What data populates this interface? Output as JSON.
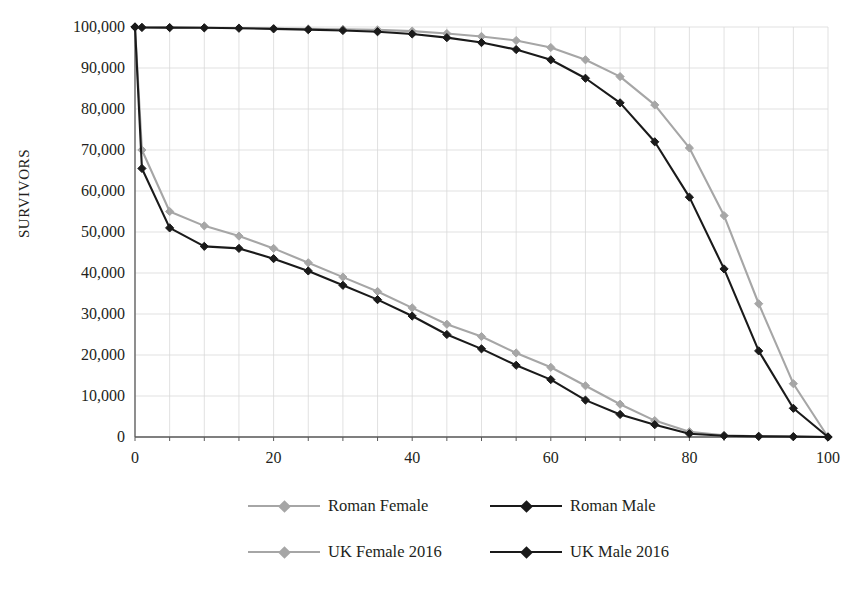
{
  "chart_data": {
    "type": "line",
    "title": "",
    "subtitle": "",
    "xlabel": "",
    "ylabel": "SURVIVORS",
    "xlim": [
      0,
      100
    ],
    "ylim": [
      0,
      100000
    ],
    "xticks": [
      0,
      20,
      40,
      60,
      80,
      100
    ],
    "xtick_labels": [
      "0",
      "20",
      "40",
      "60",
      "80",
      "100"
    ],
    "yticks": [
      0,
      10000,
      20000,
      30000,
      40000,
      50000,
      60000,
      70000,
      80000,
      90000,
      100000
    ],
    "ytick_labels": [
      "0",
      "10,000",
      "20,000",
      "30,000",
      "40,000",
      "50,000",
      "60,000",
      "70,000",
      "80,000",
      "90,000",
      "100,000"
    ],
    "grid": true,
    "grid_color": "#d9d9d9",
    "legend_position": "bottom",
    "x": [
      0,
      1,
      5,
      10,
      15,
      20,
      25,
      30,
      35,
      40,
      45,
      50,
      55,
      60,
      65,
      70,
      75,
      80,
      85,
      90,
      95,
      100
    ],
    "series": [
      {
        "name": "Roman Female",
        "color": "#a6a6a6",
        "marker": "diamond",
        "values": [
          100000,
          70000,
          55000,
          51500,
          49000,
          46000,
          42500,
          39000,
          35500,
          31500,
          27500,
          24500,
          20500,
          17000,
          12500,
          8000,
          4000,
          1300,
          400,
          200,
          100,
          0
        ]
      },
      {
        "name": "Roman Male",
        "color": "#1a1a1a",
        "marker": "diamond",
        "values": [
          100000,
          65500,
          51000,
          46500,
          46000,
          43500,
          40500,
          37000,
          33500,
          29500,
          25000,
          21500,
          17500,
          14000,
          9000,
          5500,
          3000,
          800,
          300,
          150,
          80,
          0
        ]
      },
      {
        "name": "UK Female 2016",
        "color": "#a6a6a6",
        "marker": "diamond",
        "values": [
          100000,
          99900,
          99850,
          99800,
          99750,
          99650,
          99550,
          99450,
          99300,
          99000,
          98400,
          97700,
          96700,
          95000,
          92000,
          87900,
          81000,
          70500,
          54000,
          32500,
          13000,
          0
        ]
      },
      {
        "name": "UK Male 2016",
        "color": "#1a1a1a",
        "marker": "diamond",
        "values": [
          100000,
          99900,
          99850,
          99800,
          99700,
          99550,
          99350,
          99150,
          98850,
          98300,
          97400,
          96200,
          94500,
          92000,
          87500,
          81500,
          72000,
          58500,
          41000,
          21000,
          7000,
          0
        ]
      }
    ]
  },
  "legend": {
    "items": [
      {
        "label": "Roman Female",
        "color": "#a6a6a6"
      },
      {
        "label": "Roman Male",
        "color": "#1a1a1a"
      },
      {
        "label": "UK Female 2016",
        "color": "#a6a6a6"
      },
      {
        "label": "UK Male 2016",
        "color": "#1a1a1a"
      }
    ]
  }
}
